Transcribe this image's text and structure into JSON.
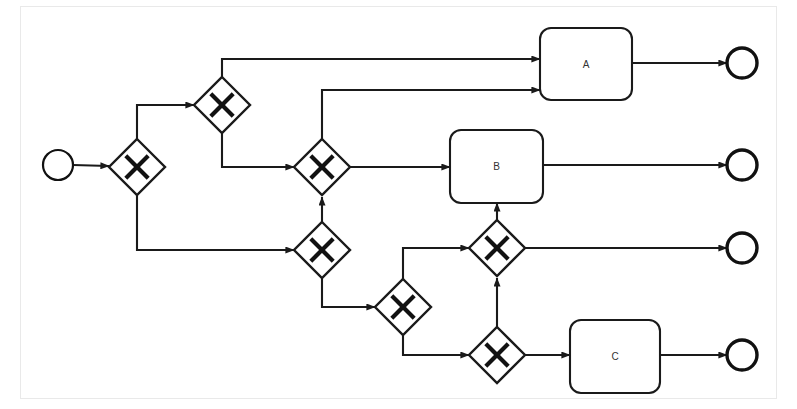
{
  "diagram": {
    "kind": "bpmn-process",
    "notation": "BPMN 2.0",
    "canvas": {
      "width": 797,
      "height": 409,
      "background": "#ffffff"
    },
    "colors": {
      "stroke": "#1a1a1a",
      "gateway_marker": "#111111",
      "shape_fill": "#ffffff",
      "label_text": "#333333",
      "frame": "#e9e9e9"
    }
  },
  "events": {
    "start": [
      {
        "id": "start-event",
        "name": "start-event",
        "label": "",
        "cx": 58,
        "cy": 165,
        "r": 15
      }
    ],
    "end": [
      {
        "id": "end-event-a",
        "name": "end-event-a",
        "label": "",
        "cx": 742,
        "cy": 63,
        "r": 15
      },
      {
        "id": "end-event-b",
        "name": "end-event-b",
        "label": "",
        "cx": 742,
        "cy": 165,
        "r": 15
      },
      {
        "id": "end-event-mid",
        "name": "end-event-mid",
        "label": "",
        "cx": 742,
        "cy": 248,
        "r": 15
      },
      {
        "id": "end-event-c",
        "name": "end-event-c",
        "label": "",
        "cx": 742,
        "cy": 355,
        "r": 15
      }
    ]
  },
  "gateways": [
    {
      "id": "gw1",
      "name": "gateway-1",
      "marker": "X",
      "type": "exclusive",
      "cx": 137,
      "cy": 167,
      "half": 28
    },
    {
      "id": "gw2",
      "name": "gateway-2",
      "marker": "X",
      "type": "exclusive",
      "cx": 222,
      "cy": 105,
      "half": 28
    },
    {
      "id": "gw3",
      "name": "gateway-3",
      "marker": "X",
      "type": "exclusive",
      "cx": 322,
      "cy": 167,
      "half": 28
    },
    {
      "id": "gw4",
      "name": "gateway-4",
      "marker": "X",
      "type": "exclusive",
      "cx": 322,
      "cy": 250,
      "half": 28
    },
    {
      "id": "gw5",
      "name": "gateway-5",
      "marker": "X",
      "type": "exclusive",
      "cx": 403,
      "cy": 307,
      "half": 28
    },
    {
      "id": "gw6",
      "name": "gateway-6",
      "marker": "X",
      "type": "exclusive",
      "cx": 497,
      "cy": 248,
      "half": 28
    },
    {
      "id": "gw7",
      "name": "gateway-7",
      "marker": "X",
      "type": "exclusive",
      "cx": 497,
      "cy": 355,
      "half": 28
    }
  ],
  "tasks": [
    {
      "id": "task-a",
      "name": "task-a",
      "label": "A",
      "x": 540,
      "y": 28,
      "w": 92,
      "h": 72,
      "rx": 11
    },
    {
      "id": "task-b",
      "name": "task-b",
      "label": "B",
      "x": 450,
      "y": 130,
      "w": 93,
      "h": 73,
      "rx": 11
    },
    {
      "id": "task-c",
      "name": "task-c",
      "label": "C",
      "x": 570,
      "y": 320,
      "w": 90,
      "h": 73,
      "rx": 11
    }
  ],
  "flows": [
    {
      "id": "f1",
      "name": "flow-start-to-gw1",
      "from": "start-event",
      "to": "gw1",
      "points": "73,165 109,166",
      "arrow": true
    },
    {
      "id": "f2",
      "name": "flow-gw1-to-gw2",
      "from": "gw1",
      "to": "gw2",
      "points": "137,139 137,105 194,105",
      "arrow": true
    },
    {
      "id": "f3",
      "name": "flow-gw1-to-gw4",
      "from": "gw1",
      "to": "gw4",
      "points": "137,195 137,250 294,250",
      "arrow": true
    },
    {
      "id": "f4",
      "name": "flow-gw2-to-task-a",
      "from": "gw2",
      "to": "task-a",
      "points": "222,77 222,59 540,59",
      "arrow": true
    },
    {
      "id": "f5",
      "name": "flow-gw2-to-gw3",
      "from": "gw2",
      "to": "gw3",
      "points": "222,133 222,167 294,167",
      "arrow": true
    },
    {
      "id": "f6",
      "name": "flow-gw3-to-task-a",
      "from": "gw3",
      "to": "task-a",
      "points": "322,139 322,90 540,90",
      "arrow": true
    },
    {
      "id": "f7",
      "name": "flow-gw3-to-task-b",
      "from": "gw3",
      "to": "task-b",
      "points": "350,167 450,167",
      "arrow": true
    },
    {
      "id": "f8",
      "name": "flow-gw4-to-gw3",
      "from": "gw4",
      "to": "gw3",
      "points": "322,222 322,197",
      "arrow": true
    },
    {
      "id": "f9",
      "name": "flow-gw4-to-gw5",
      "from": "gw4",
      "to": "gw5",
      "points": "322,278 322,307 375,307",
      "arrow": true
    },
    {
      "id": "f10",
      "name": "flow-gw5-to-gw6",
      "from": "gw5",
      "to": "gw6",
      "points": "403,279 403,248 469,248",
      "arrow": true
    },
    {
      "id": "f11",
      "name": "flow-gw5-to-gw7",
      "from": "gw5",
      "to": "gw7",
      "points": "403,335 403,355 469,355",
      "arrow": true
    },
    {
      "id": "f12",
      "name": "flow-gw7-to-gw6",
      "from": "gw7",
      "to": "gw6",
      "points": "497,327 497,278",
      "arrow": true
    },
    {
      "id": "f13",
      "name": "flow-gw6-to-task-b",
      "from": "gw6",
      "to": "task-b",
      "points": "497,220 497,203",
      "arrow": true
    },
    {
      "id": "f14",
      "name": "flow-gw6-to-end-mid",
      "from": "gw6",
      "to": "end-event-mid",
      "points": "525,248 727,248",
      "arrow": true
    },
    {
      "id": "f15",
      "name": "flow-gw7-to-task-c",
      "from": "gw7",
      "to": "task-c",
      "points": "525,355 570,355",
      "arrow": true
    },
    {
      "id": "f16",
      "name": "flow-task-a-to-end-a",
      "from": "task-a",
      "to": "end-event-a",
      "points": "632,63 727,63",
      "arrow": true
    },
    {
      "id": "f17",
      "name": "flow-task-b-to-end-b",
      "from": "task-b",
      "to": "end-event-b",
      "points": "543,165 727,165",
      "arrow": true
    },
    {
      "id": "f18",
      "name": "flow-task-c-to-end-c",
      "from": "task-c",
      "to": "end-event-c",
      "points": "660,355 727,355",
      "arrow": true
    }
  ]
}
